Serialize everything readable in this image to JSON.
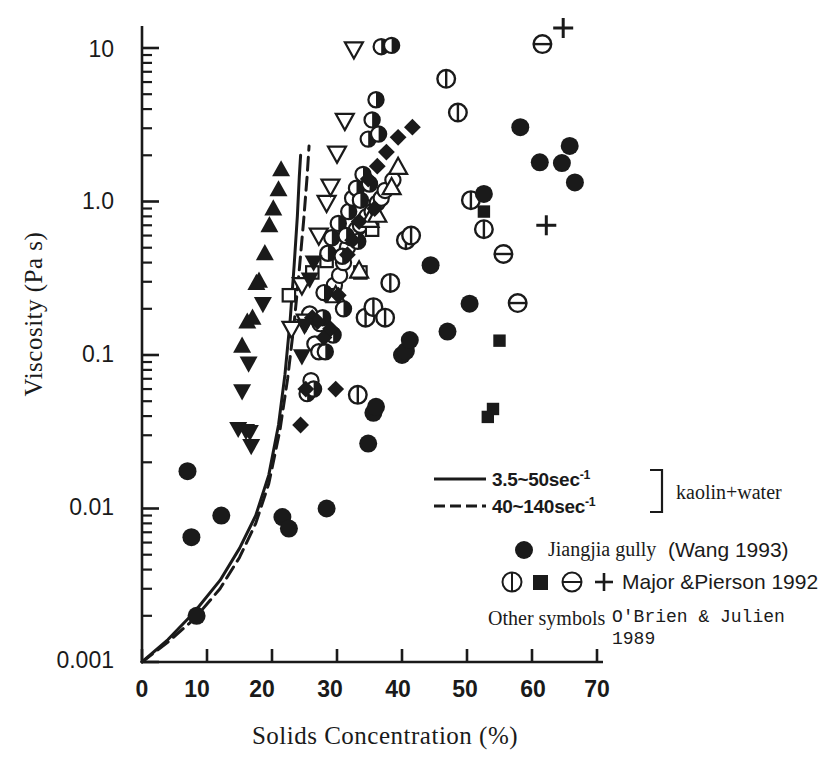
{
  "chart_data": {
    "type": "scatter",
    "title": "",
    "xlabel": "Solids Concentration (%)",
    "ylabel": "Viscosity  (Pa s)",
    "xlim": [
      0,
      70
    ],
    "ylim": [
      0.001,
      20
    ],
    "yscale": "log",
    "xticks": [
      0,
      10,
      20,
      30,
      40,
      50,
      60,
      70
    ],
    "xtick_labels": [
      "0",
      "10",
      "20",
      "30",
      "40",
      "50",
      "60",
      "70"
    ],
    "yticks": [
      0.001,
      0.01,
      0.1,
      1.0,
      10
    ],
    "ytick_labels": [
      "0.001",
      "0.01",
      "0.1",
      "1.0",
      "10"
    ],
    "grid": false,
    "legend_position": "lower-right-inside",
    "series": [
      {
        "name": "Jiangjia gully (Wang 1993)",
        "symbol": "filled-circle",
        "points": [
          [
            7.0,
            0.0175
          ],
          [
            7.6,
            0.0065
          ],
          [
            8.4,
            0.002
          ],
          [
            12.2,
            0.009
          ],
          [
            21.6,
            0.0088
          ],
          [
            22.6,
            0.0074
          ],
          [
            28.4,
            0.01
          ],
          [
            34.8,
            0.0265
          ],
          [
            35.6,
            0.042
          ],
          [
            36.0,
            0.046
          ],
          [
            40.0,
            0.1
          ],
          [
            40.6,
            0.106
          ],
          [
            41.2,
            0.125
          ],
          [
            44.4,
            0.385
          ],
          [
            47.0,
            0.142
          ],
          [
            50.4,
            0.216
          ],
          [
            52.6,
            1.12
          ],
          [
            58.2,
            3.05
          ],
          [
            61.2,
            1.8
          ],
          [
            64.6,
            1.78
          ],
          [
            65.8,
            2.3
          ],
          [
            66.6,
            1.33
          ]
        ]
      },
      {
        "name": "Major & Pierson 1992 (vertical-split circle)",
        "symbol": "circle-vsplit",
        "points": [
          [
            33.2,
            0.055
          ],
          [
            34.4,
            0.175
          ],
          [
            35.6,
            0.205
          ],
          [
            37.4,
            0.175
          ],
          [
            38.2,
            0.295
          ],
          [
            40.6,
            0.56
          ],
          [
            41.4,
            0.6
          ],
          [
            46.8,
            6.3
          ],
          [
            48.6,
            3.8
          ],
          [
            50.6,
            1.02
          ],
          [
            52.6,
            0.66
          ]
        ]
      },
      {
        "name": "Major & Pierson 1992 (filled square)",
        "symbol": "filled-square",
        "points": [
          [
            52.6,
            0.86
          ],
          [
            55.0,
            0.124
          ],
          [
            54.0,
            0.0445
          ],
          [
            53.2,
            0.0395
          ]
        ]
      },
      {
        "name": "Major & Pierson 1992 (horizontal-split circle)",
        "symbol": "circle-hsplit",
        "points": [
          [
            55.6,
            0.455
          ],
          [
            57.8,
            0.218
          ],
          [
            61.6,
            10.6
          ]
        ]
      },
      {
        "name": "Major & Pierson 1992 (plus)",
        "symbol": "plus",
        "points": [
          [
            64.8,
            13.5
          ],
          [
            62.2,
            0.7
          ]
        ]
      },
      {
        "name": "O'Brien & Julien 1989 (filled triangle up)",
        "symbol": "filled-triangle-up",
        "points": [
          [
            21.4,
            1.62
          ],
          [
            21.0,
            1.2
          ],
          [
            20.2,
            0.9
          ],
          [
            19.6,
            0.7
          ],
          [
            18.9,
            0.46
          ],
          [
            18.0,
            0.305
          ],
          [
            17.6,
            0.295
          ],
          [
            17.0,
            0.175
          ],
          [
            16.2,
            0.165
          ],
          [
            15.4,
            0.115
          ]
        ]
      },
      {
        "name": "O'Brien & Julien 1989 (filled triangle down)",
        "symbol": "filled-triangle-down",
        "points": [
          [
            18.6,
            0.215
          ],
          [
            16.4,
            0.088
          ],
          [
            15.4,
            0.058
          ],
          [
            14.8,
            0.033
          ],
          [
            16.0,
            0.032
          ],
          [
            16.6,
            0.0315
          ],
          [
            16.8,
            0.0255
          ],
          [
            24.6,
            0.098
          ],
          [
            25.0,
            0.155
          ],
          [
            25.8,
            0.31
          ],
          [
            26.4,
            0.4
          ]
        ]
      },
      {
        "name": "O'Brien & Julien 1989 (open triangle down)",
        "symbol": "open-triangle-down",
        "points": [
          [
            24.6,
            0.285
          ],
          [
            25.2,
            0.165
          ],
          [
            27.2,
            0.6
          ],
          [
            28.4,
            0.98
          ],
          [
            29.0,
            1.25
          ],
          [
            30.0,
            2.05
          ],
          [
            31.2,
            3.35
          ],
          [
            32.6,
            9.8
          ],
          [
            23.0,
            0.148
          ]
        ]
      },
      {
        "name": "O'Brien & Julien 1989 (open triangle up)",
        "symbol": "open-triangle-up",
        "points": [
          [
            29.8,
            0.245
          ],
          [
            33.4,
            0.355
          ],
          [
            35.0,
            0.76
          ],
          [
            36.2,
            0.82
          ],
          [
            38.4,
            1.24
          ],
          [
            39.4,
            1.68
          ]
        ]
      },
      {
        "name": "O'Brien & Julien 1989 (open square)",
        "symbol": "open-square",
        "points": [
          [
            22.6,
            0.245
          ],
          [
            26.2,
            0.345
          ],
          [
            28.4,
            0.41
          ],
          [
            29.2,
            0.245
          ],
          [
            33.6,
            0.345
          ],
          [
            35.4,
            0.655
          ]
        ]
      },
      {
        "name": "O'Brien & Julien 1989 (open circle)",
        "symbol": "open-circle",
        "points": [
          [
            26.6,
            0.118
          ],
          [
            27.4,
            0.16
          ],
          [
            28.6,
            0.25
          ],
          [
            29.6,
            0.285
          ],
          [
            30.4,
            0.33
          ],
          [
            31.0,
            0.4
          ],
          [
            31.6,
            0.5
          ],
          [
            32.2,
            0.58
          ],
          [
            33.0,
            0.66
          ],
          [
            33.6,
            0.7
          ],
          [
            34.6,
            0.8
          ],
          [
            35.4,
            0.86
          ],
          [
            36.2,
            0.98
          ],
          [
            36.8,
            1.05
          ],
          [
            37.4,
            1.18
          ],
          [
            38.6,
            1.38
          ],
          [
            25.8,
            0.185
          ],
          [
            26.0,
            0.068
          ]
        ]
      },
      {
        "name": "O'Brien & Julien 1989 (half-filled circle)",
        "symbol": "half-circle",
        "points": [
          [
            25.4,
            0.056
          ],
          [
            26.4,
            0.06
          ],
          [
            27.2,
            0.105
          ],
          [
            27.8,
            0.175
          ],
          [
            28.0,
            0.255
          ],
          [
            28.6,
            0.46
          ],
          [
            29.2,
            0.58
          ],
          [
            30.2,
            0.72
          ],
          [
            30.8,
            0.44
          ],
          [
            31.4,
            0.6
          ],
          [
            31.8,
            0.86
          ],
          [
            32.4,
            1.05
          ],
          [
            33.0,
            1.22
          ],
          [
            33.6,
            1.02
          ],
          [
            34.0,
            1.5
          ],
          [
            34.8,
            2.55
          ],
          [
            35.4,
            3.4
          ],
          [
            36.0,
            4.6
          ],
          [
            36.8,
            10.2
          ],
          [
            38.4,
            10.4
          ],
          [
            31.0,
            0.2
          ],
          [
            29.4,
            0.135
          ],
          [
            28.2,
            0.105
          ],
          [
            35.0,
            1.3
          ],
          [
            36.4,
            2.75
          ],
          [
            33.2,
            0.55
          ]
        ]
      },
      {
        "name": "O'Brien & Julien 1989 (filled diamond)",
        "symbol": "filled-diamond",
        "points": [
          [
            26.2,
            0.175
          ],
          [
            27.0,
            0.165
          ],
          [
            28.0,
            0.13
          ],
          [
            29.0,
            0.148
          ],
          [
            30.2,
            0.245
          ],
          [
            31.6,
            0.45
          ],
          [
            32.4,
            0.56
          ],
          [
            33.4,
            0.74
          ],
          [
            34.8,
            1.4
          ],
          [
            36.2,
            1.7
          ],
          [
            37.6,
            2.1
          ],
          [
            39.4,
            2.62
          ],
          [
            41.6,
            3.05
          ],
          [
            29.8,
            0.06
          ],
          [
            24.4,
            0.035
          ],
          [
            25.2,
            0.06
          ],
          [
            35.8,
            0.9
          ]
        ]
      }
    ],
    "curves": [
      {
        "name": "3.5~50sec-1",
        "style": "solid",
        "points": [
          [
            0,
            0.001
          ],
          [
            4,
            0.0014
          ],
          [
            8,
            0.0021
          ],
          [
            12,
            0.0034
          ],
          [
            15,
            0.0055
          ],
          [
            17.5,
            0.009
          ],
          [
            19.5,
            0.0165
          ],
          [
            21,
            0.035
          ],
          [
            22,
            0.075
          ],
          [
            22.8,
            0.17
          ],
          [
            23.4,
            0.38
          ],
          [
            23.9,
            0.8
          ],
          [
            24.2,
            1.45
          ],
          [
            24.4,
            2.0
          ]
        ]
      },
      {
        "name": "40~140sec-1",
        "style": "dashed",
        "points": [
          [
            0,
            0.001
          ],
          [
            4,
            0.00135
          ],
          [
            8,
            0.0019
          ],
          [
            12,
            0.003
          ],
          [
            15,
            0.0048
          ],
          [
            17.5,
            0.008
          ],
          [
            19.5,
            0.0145
          ],
          [
            21.2,
            0.032
          ],
          [
            22.4,
            0.07
          ],
          [
            23.4,
            0.16
          ],
          [
            24.2,
            0.36
          ],
          [
            24.9,
            0.78
          ],
          [
            25.4,
            1.45
          ],
          [
            25.7,
            2.3
          ]
        ]
      }
    ]
  },
  "legend": {
    "curve_solid_label": "3.5~50sec",
    "curve_solid_exp": "-1",
    "curve_dashed_label": "40~140sec",
    "curve_dashed_exp": "-1",
    "bracket_label": "kaolin+water",
    "entry_jiangjia": "Jiangjia gully",
    "entry_jiangjia_ref": "(Wang  1993)",
    "entry_major": "Major &Pierson 1992",
    "entry_other_prefix": "Other symbols",
    "entry_other_ref_line1": "O'Brien & Julien",
    "entry_other_ref_line2": "1989"
  },
  "colors": {
    "ink": "#1a1a1a",
    "background": "#ffffff"
  }
}
